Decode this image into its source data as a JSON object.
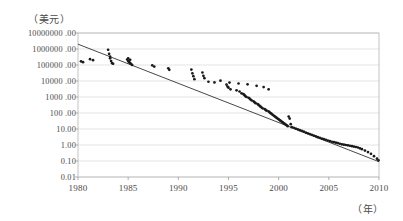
{
  "chart_data": {
    "type": "scatter",
    "title": "",
    "subtitle": "",
    "xlabel": "（年）",
    "ylabel": "（美元）",
    "xlim": [
      1980,
      2010
    ],
    "ylim": [
      0.01,
      10000000
    ],
    "yscale": "log",
    "grid": true,
    "legend": null,
    "xticks": [
      "1980",
      "1985",
      "1990",
      "1995",
      "2000",
      "2005",
      "2010"
    ],
    "xtick_values": [
      1980,
      1985,
      1990,
      1995,
      2000,
      2005,
      2010
    ],
    "yticks": [
      "10000000 .00",
      "1000000 .00",
      "100000 .00",
      "10000 .00",
      "1000 .00",
      "100 .00",
      "10.00",
      "1.00",
      "0.10",
      "0.01"
    ],
    "ytick_values": [
      10000000,
      1000000,
      100000,
      10000,
      1000,
      100,
      10,
      1,
      0.1,
      0.01
    ],
    "series": [
      {
        "name": "observations",
        "marker": "dot",
        "color": "#1a1a1a",
        "points": [
          [
            1980.3,
            170000
          ],
          [
            1980.5,
            150000
          ],
          [
            1981.2,
            230000
          ],
          [
            1981.5,
            200000
          ],
          [
            1983.0,
            900000
          ],
          [
            1983.1,
            500000
          ],
          [
            1983.2,
            330000
          ],
          [
            1983.2,
            260000
          ],
          [
            1983.3,
            175000
          ],
          [
            1983.4,
            130000
          ],
          [
            1983.5,
            120000
          ],
          [
            1984.9,
            220000
          ],
          [
            1985.0,
            175000
          ],
          [
            1985.1,
            150000
          ],
          [
            1985.2,
            130000
          ],
          [
            1985.3,
            115000
          ],
          [
            1985.4,
            100000
          ],
          [
            1985.0,
            260000
          ],
          [
            1985.2,
            210000
          ],
          [
            1987.4,
            95000
          ],
          [
            1987.6,
            80000
          ],
          [
            1989.0,
            62000
          ],
          [
            1989.1,
            50000
          ],
          [
            1991.3,
            52000
          ],
          [
            1991.4,
            30000
          ],
          [
            1991.5,
            20000
          ],
          [
            1991.6,
            13000
          ],
          [
            1992.4,
            34000
          ],
          [
            1992.5,
            21000
          ],
          [
            1992.6,
            15000
          ],
          [
            1994.2,
            10500
          ],
          [
            1995.1,
            8000
          ],
          [
            1996.0,
            7000
          ],
          [
            1996.9,
            6200
          ],
          [
            1997.8,
            5000
          ],
          [
            1998.5,
            4200
          ],
          [
            1999.0,
            3000
          ],
          [
            1993.0,
            9000
          ],
          [
            1993.6,
            8200
          ],
          [
            1994.8,
            6000
          ],
          [
            1994.9,
            4500
          ],
          [
            1995.0,
            3800
          ],
          [
            1995.2,
            3000
          ],
          [
            1995.8,
            2600
          ],
          [
            1996.1,
            2200
          ],
          [
            1996.3,
            1700
          ],
          [
            1996.5,
            1500
          ],
          [
            1996.6,
            1300
          ],
          [
            1996.7,
            1100
          ],
          [
            1996.8,
            1000
          ],
          [
            1997.0,
            900
          ],
          [
            1997.1,
            800
          ],
          [
            1997.2,
            700
          ],
          [
            1997.3,
            620
          ],
          [
            1997.5,
            540
          ],
          [
            1997.6,
            470
          ],
          [
            1997.7,
            410
          ],
          [
            1997.9,
            360
          ],
          [
            1998.0,
            320
          ],
          [
            1998.1,
            280
          ],
          [
            1998.2,
            250
          ],
          [
            1998.3,
            220
          ],
          [
            1998.4,
            195
          ],
          [
            1998.6,
            175
          ],
          [
            1998.7,
            155
          ],
          [
            1998.8,
            140
          ],
          [
            1999.0,
            125
          ],
          [
            1999.1,
            110
          ],
          [
            1999.2,
            98
          ],
          [
            1999.3,
            88
          ],
          [
            1999.4,
            78
          ],
          [
            1999.5,
            70
          ],
          [
            1999.6,
            62
          ],
          [
            1999.7,
            56
          ],
          [
            1999.8,
            50
          ],
          [
            1999.9,
            45
          ],
          [
            2000.0,
            40
          ],
          [
            2000.1,
            36
          ],
          [
            2000.2,
            32
          ],
          [
            2000.3,
            29
          ],
          [
            2000.4,
            26
          ],
          [
            2000.5,
            23
          ],
          [
            2000.6,
            21
          ],
          [
            2000.7,
            19
          ],
          [
            2000.8,
            17
          ],
          [
            2000.9,
            15
          ],
          [
            2001.0,
            60
          ],
          [
            2001.1,
            45
          ],
          [
            2001.2,
            20
          ],
          [
            2001.3,
            13
          ],
          [
            2001.5,
            12
          ],
          [
            2001.7,
            10.5
          ],
          [
            2001.9,
            9.5
          ],
          [
            2002.1,
            8.5
          ],
          [
            2002.3,
            7.6
          ],
          [
            2002.5,
            6.8
          ],
          [
            2002.7,
            6.0
          ],
          [
            2002.9,
            5.4
          ],
          [
            2003.1,
            4.8
          ],
          [
            2003.3,
            4.3
          ],
          [
            2003.5,
            3.9
          ],
          [
            2003.7,
            3.5
          ],
          [
            2003.9,
            3.1
          ],
          [
            2004.1,
            2.8
          ],
          [
            2004.3,
            2.5
          ],
          [
            2004.5,
            2.3
          ],
          [
            2004.7,
            2.1
          ],
          [
            2004.9,
            1.9
          ],
          [
            2005.1,
            1.75
          ],
          [
            2005.3,
            1.6
          ],
          [
            2005.5,
            1.5
          ],
          [
            2005.7,
            1.4
          ],
          [
            2005.9,
            1.3
          ],
          [
            2006.1,
            1.2
          ],
          [
            2006.3,
            1.1
          ],
          [
            2006.5,
            1.05
          ],
          [
            2006.7,
            1.0
          ],
          [
            2006.9,
            0.95
          ],
          [
            2007.1,
            0.9
          ],
          [
            2007.3,
            0.85
          ],
          [
            2007.5,
            0.8
          ],
          [
            2007.7,
            0.75
          ],
          [
            2007.9,
            0.7
          ],
          [
            2008.1,
            0.62
          ],
          [
            2008.3,
            0.55
          ],
          [
            2008.6,
            0.45
          ],
          [
            2008.9,
            0.36
          ],
          [
            2009.2,
            0.28
          ],
          [
            2009.5,
            0.2
          ],
          [
            2009.8,
            0.14
          ],
          [
            2009.95,
            0.11
          ]
        ]
      }
    ],
    "trendline": {
      "name": "fit",
      "color": "#333333",
      "start": [
        1980,
        2000000
      ],
      "end": [
        2010,
        0.09
      ]
    }
  }
}
